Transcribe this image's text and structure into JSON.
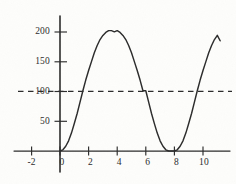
{
  "figure": {
    "background_color": "#fdfdfb",
    "ink_color": "#2b2b2b"
  },
  "chart_data": {
    "type": "line",
    "title": "",
    "subtitle": "",
    "xlabel": "",
    "ylabel": "",
    "xlim": [
      -2.8,
      11.6
    ],
    "ylim": [
      -18,
      215
    ],
    "grid": false,
    "legend_position": "none",
    "x_ticks": [
      -2,
      0,
      2,
      4,
      6,
      8,
      10
    ],
    "x_tick_labels": [
      "-2",
      "0",
      "2",
      "4",
      "6",
      "8",
      "10"
    ],
    "y_ticks": [
      50,
      100,
      150,
      200
    ],
    "y_tick_labels": [
      "50",
      "100",
      "150",
      "200"
    ],
    "series": [
      {
        "name": "curve",
        "style": "solid",
        "color": "#2b2b2b",
        "x": [
          0.0,
          0.2,
          0.4,
          0.6,
          0.8,
          1.0,
          1.2,
          1.4,
          1.6,
          1.8,
          2.0,
          2.2,
          2.4,
          2.6,
          2.8,
          3.0,
          3.2,
          3.4,
          3.6,
          3.8,
          4.0,
          4.2,
          4.4,
          4.6,
          4.8,
          5.0,
          5.2,
          5.4,
          5.6,
          5.8,
          6.0,
          6.2,
          6.4,
          6.6,
          6.8,
          7.0,
          7.2,
          7.4,
          7.6,
          7.8,
          8.0,
          8.2,
          8.4,
          8.6,
          8.8,
          9.0,
          9.2,
          9.4,
          9.6,
          9.8,
          10.0,
          10.2,
          10.4,
          10.6,
          10.8,
          11.0,
          11.2
        ],
        "y": [
          0,
          2,
          8,
          17,
          30,
          46,
          63,
          82,
          101,
          119,
          135,
          150,
          165,
          177,
          187,
          194,
          199,
          202,
          202,
          200,
          202,
          199,
          194,
          187,
          177,
          165,
          150,
          135,
          119,
          101,
          101,
          82,
          63,
          46,
          30,
          17,
          8,
          2,
          0,
          0,
          0,
          2,
          8,
          17,
          30,
          46,
          63,
          82,
          101,
          119,
          135,
          150,
          165,
          177,
          187,
          194,
          185
        ]
      },
      {
        "name": "reference-line",
        "style": "dashed",
        "color": "#2b2b2b",
        "y_value": 100
      }
    ],
    "annotations": [
      {
        "label": "local maximum",
        "x": 4,
        "y": 202
      },
      {
        "label": "local minimum",
        "x": 8,
        "y": 0
      },
      {
        "label": "dashed reference level",
        "y": 100
      }
    ]
  }
}
